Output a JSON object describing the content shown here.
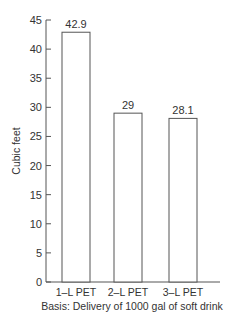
{
  "chart_data": {
    "type": "bar",
    "title": "",
    "xlabel": "Basis: Delivery of 1000 gal of soft drink",
    "ylabel": "Cubic feet",
    "categories": [
      "1–L PET",
      "2–L PET",
      "3–L PET"
    ],
    "values": [
      42.9,
      29,
      28.1
    ],
    "value_labels": [
      "42.9",
      "29",
      "28.1"
    ],
    "ylim": [
      0,
      45
    ],
    "yticks": [
      "0",
      "5",
      "10",
      "15",
      "20",
      "25",
      "30",
      "35",
      "40",
      "45"
    ],
    "grid": false,
    "legend": null
  }
}
